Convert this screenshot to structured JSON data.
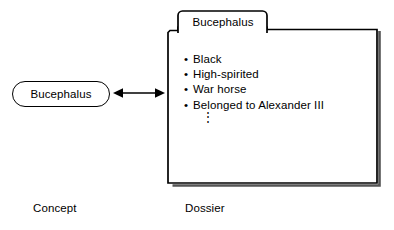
{
  "diagram": {
    "background_color": "#ffffff",
    "stroke_color": "#000000",
    "concept": {
      "shape": "rounded-stadium",
      "label": "Bucephalus",
      "caption": "Concept"
    },
    "link": {
      "icon": "double-headed-arrow-icon",
      "direction": "bidirectional"
    },
    "dossier": {
      "shape": "tabbed-folder",
      "tab_label": "Bucephalus",
      "caption": "Dossier",
      "attributes": [
        {
          "bullet": "•",
          "text": "Black"
        },
        {
          "bullet": "•",
          "text": "High-spirited"
        },
        {
          "bullet": "•",
          "text": "War horse"
        },
        {
          "bullet": "•",
          "text": "Belonged to Alexander III"
        }
      ],
      "continuation": "⋮"
    }
  }
}
